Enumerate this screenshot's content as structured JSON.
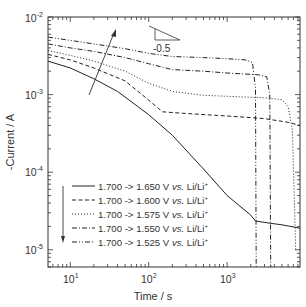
{
  "chart_data": {
    "type": "line",
    "title": "",
    "xlabel": "Time / s",
    "ylabel": "-Current / A",
    "xscale": "log",
    "yscale": "log",
    "xlim": [
      5.2,
      8500
    ],
    "ylim": [
      6e-06,
      0.01
    ],
    "grid": false,
    "legend_position": "lower left (inside)",
    "x_ticks": [
      {
        "value": 10,
        "base": "10",
        "exp": "1"
      },
      {
        "value": 100,
        "base": "10",
        "exp": "2"
      },
      {
        "value": 1000,
        "base": "10",
        "exp": "3"
      }
    ],
    "y_ticks": [
      {
        "value": 0.01,
        "base": "10",
        "exp": "-2"
      },
      {
        "value": 0.001,
        "base": "10",
        "exp": "-3"
      },
      {
        "value": 0.0001,
        "base": "10",
        "exp": "-4"
      },
      {
        "value": 1e-05,
        "base": "10",
        "exp": "-5"
      }
    ],
    "series": [
      {
        "name": "1.700 -> 1.650 V vs. Li/Li+",
        "style": "solid",
        "x": [
          5.2,
          10,
          20,
          40,
          100,
          200,
          500,
          1000,
          2000,
          2300,
          3500,
          5000,
          8500
        ],
        "y": [
          0.0027,
          0.0022,
          0.0016,
          0.0011,
          0.00055,
          0.0003,
          0.00011,
          5e-05,
          2.8e-05,
          2.35e-05,
          2.2e-05,
          2.1e-05,
          1.9e-05
        ]
      },
      {
        "name": "1.700 -> 1.600 V vs. Li/Li+",
        "style": "dashed",
        "x": [
          5.2,
          10,
          20,
          50,
          100,
          150,
          300,
          1000,
          3000,
          6000,
          8500
        ],
        "y": [
          0.0033,
          0.0028,
          0.0022,
          0.0015,
          0.00085,
          0.0006,
          0.00057,
          0.00053,
          0.00049,
          0.00044,
          0.0004
        ]
      },
      {
        "name": "1.700 -> 1.575 V vs. Li/Li+",
        "style": "dotted",
        "x": [
          5.2,
          10,
          20,
          50,
          100,
          200,
          500,
          1000,
          3000,
          5000,
          6000,
          6800,
          7500
        ],
        "y": [
          0.0037,
          0.0032,
          0.0027,
          0.002,
          0.0014,
          0.0011,
          0.00098,
          0.00095,
          0.00091,
          0.00086,
          0.0007,
          0.00035,
          1e-05
        ]
      },
      {
        "name": "1.700 -> 1.550 V vs. Li/Li+",
        "style": "dash-dot",
        "x": [
          5.2,
          10,
          20,
          50,
          100,
          200,
          500,
          1000,
          2500,
          3200,
          3500,
          3600
        ],
        "y": [
          0.0045,
          0.004,
          0.0036,
          0.003,
          0.0025,
          0.0021,
          0.002,
          0.0019,
          0.0018,
          0.0017,
          0.001,
          6e-06
        ]
      },
      {
        "name": "1.700 -> 1.525 V vs. Li/Li+",
        "style": "dash-dot-dot",
        "x": [
          5.2,
          10,
          20,
          50,
          100,
          200,
          500,
          1000,
          1700,
          2100,
          2300,
          2350
        ],
        "y": [
          0.0055,
          0.005,
          0.0045,
          0.0039,
          0.0034,
          0.0031,
          0.003,
          0.0029,
          0.0028,
          0.0026,
          0.0012,
          6e-06
        ]
      }
    ],
    "annotations": [
      {
        "text": "-0.5",
        "type": "slope-triangle",
        "position": "top center-right"
      },
      {
        "type": "arrow-up",
        "description": "arrow pointing up-right across early-time curves (increasing current with larger overpotential)"
      },
      {
        "type": "arrow-down",
        "description": "arrow pointing down beside legend entries"
      }
    ]
  },
  "legend": {
    "items": [
      {
        "label": "1.700 -> 1.650 V ",
        "vs": "vs.",
        "ref": " Li/Li",
        "sup": "+"
      },
      {
        "label": "1.700 -> 1.600 V ",
        "vs": "vs.",
        "ref": " Li/Li",
        "sup": "+"
      },
      {
        "label": "1.700 -> 1.575 V ",
        "vs": "vs.",
        "ref": " Li/Li",
        "sup": "+"
      },
      {
        "label": "1.700 -> 1.550 V ",
        "vs": "vs.",
        "ref": " Li/Li",
        "sup": "+"
      },
      {
        "label": "1.700 -> 1.525 V ",
        "vs": "vs.",
        "ref": " Li/Li",
        "sup": "+"
      }
    ]
  },
  "labels": {
    "xlabel": "Time / s",
    "ylabel": "-Current / A",
    "slope": "-0.5",
    "x10": "10",
    "x10e": "1",
    "x100": "10",
    "x100e": "2",
    "x1000": "10",
    "x1000e": "3",
    "ym2": "10",
    "ym2e": "-2",
    "ym3": "10",
    "ym3e": "-3",
    "ym4": "10",
    "ym4e": "-4",
    "ym5": "10",
    "ym5e": "-5"
  },
  "colors": {
    "line": "#222222",
    "axis": "#333333",
    "text": "#333333",
    "background": "#ffffff"
  }
}
